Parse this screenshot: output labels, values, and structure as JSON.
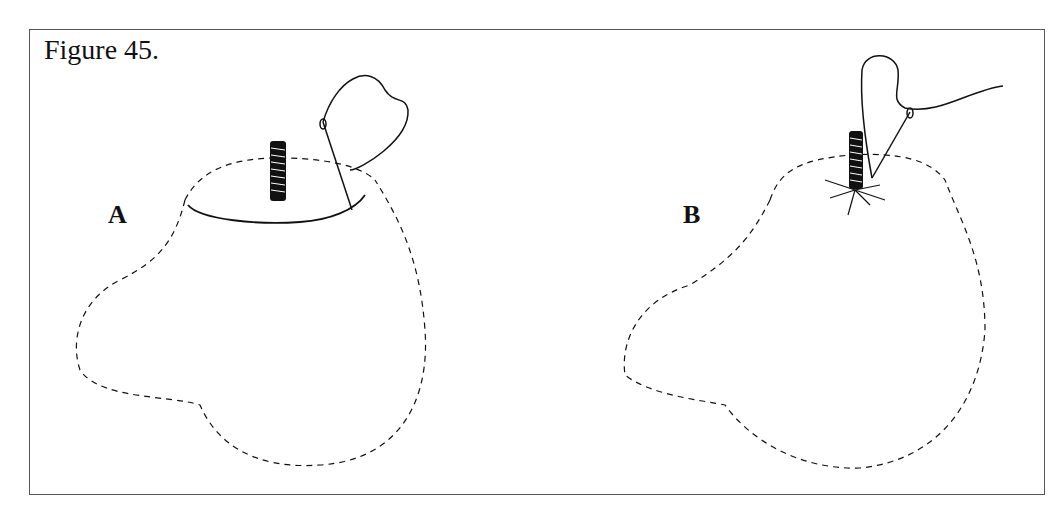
{
  "figure": {
    "title": "Figure 45.",
    "panels": [
      {
        "label": "A",
        "description": "furry pouch with drawstring hem around top, threaded post, needle and thread"
      },
      {
        "label": "B",
        "description": "pouch gathered closed around threaded post, needle and thread"
      }
    ],
    "colors": {
      "ink": "#111111",
      "border": "#555555",
      "background": "#ffffff"
    }
  }
}
